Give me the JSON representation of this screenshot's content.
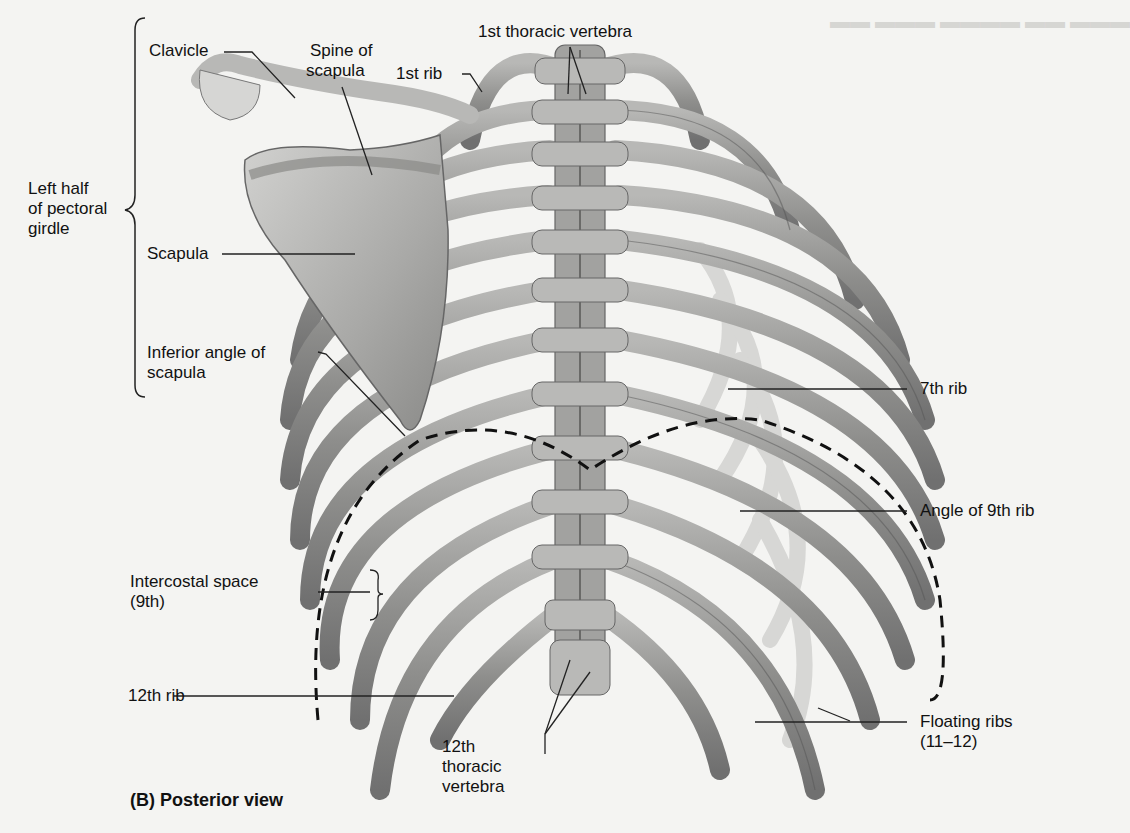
{
  "figure": {
    "caption": "(B) Posterior view",
    "view": "Posterior view of thoracic cage and left pectoral girdle"
  },
  "labels": {
    "clavicle": "Clavicle",
    "spine_of_scapula_1": "Spine of",
    "spine_of_scapula_2": "scapula",
    "first_rib": "1st rib",
    "first_thoracic_vertebra": "1st thoracic vertebra",
    "left_half_1": "Left half",
    "left_half_2": "of pectoral",
    "left_half_3": "girdle",
    "scapula": "Scapula",
    "inferior_angle_1": "Inferior angle of",
    "inferior_angle_2": "scapula",
    "seventh_rib": "7th rib",
    "angle_9th_rib": "Angle of 9th rib",
    "intercostal_1": "Intercostal space",
    "intercostal_2": "(9th)",
    "twelfth_rib": "12th rib",
    "twelfth_thoracic_1": "12th",
    "twelfth_thoracic_2": "thoracic",
    "twelfth_thoracic_3": "vertebra",
    "floating_ribs_1": "Floating ribs",
    "floating_ribs_2": "(11–12)"
  },
  "colors": {
    "background": "#f4f4f2",
    "bone_light": "#c9c9c7",
    "bone_mid": "#9d9d9b",
    "bone_dark": "#6e6e6c",
    "leader": "#222222"
  }
}
